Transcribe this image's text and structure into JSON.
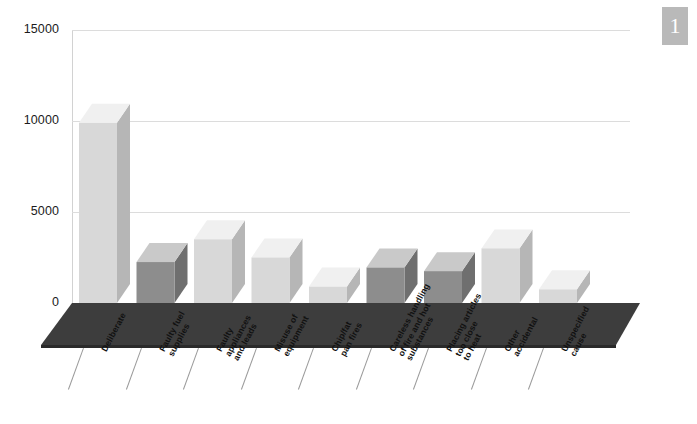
{
  "page_badge": {
    "number": "1"
  },
  "chart_data": {
    "type": "bar",
    "title": "",
    "subtitle": "",
    "xlabel": "",
    "ylabel": "",
    "ylim": [
      0,
      15000
    ],
    "grid": true,
    "legend": "none",
    "style": "3d-column",
    "yticks": [
      "0",
      "5000",
      "10000",
      "15000"
    ],
    "ytick_values": [
      0,
      5000,
      10000,
      15000
    ],
    "categories": [
      "Deliberate",
      "Faulty fuel supplies",
      "Faulty appliances and leads",
      "Misuse of equipment",
      "Chip/fat pan fires",
      "Careless handling of fire and hot substances",
      "Placing articles too close to heat",
      "Other accidental",
      "Unspecified cause"
    ],
    "values": [
      9900,
      2250,
      3500,
      2500,
      900,
      1950,
      1750,
      3000,
      750
    ],
    "bar_shades": [
      "light",
      "dark",
      "light",
      "light",
      "light",
      "dark",
      "dark",
      "light",
      "light"
    ]
  },
  "labels": [
    {
      "text": "Deliberate"
    },
    {
      "text": "Faulty fuel\nsupplies"
    },
    {
      "text": "Faulty\nappliances\nand leads"
    },
    {
      "text": "Misuse of\nequipment"
    },
    {
      "text": "Chip/fat\npan fires"
    },
    {
      "text": "Careless handling\nof fire and hot\nsubstances"
    },
    {
      "text": "Placing articles\ntoo close\nto heat"
    },
    {
      "text": "Other\naccidental"
    },
    {
      "text": "Unspecified\ncause"
    }
  ],
  "colors": {
    "bar_light_front": "#d8d8d8",
    "bar_light_top": "#f0f0f0",
    "bar_light_side": "#b6b6b6",
    "bar_dark_front": "#8d8d8d",
    "bar_dark_top": "#c9c9c9",
    "bar_dark_side": "#6f6f6f",
    "floor_top": "#3d3d3d",
    "floor_front": "#2a2a2a",
    "gridline": "#dcdcdc",
    "axis": "#d2d2d2",
    "badge": "#b9b9b9",
    "text": "#111111"
  }
}
